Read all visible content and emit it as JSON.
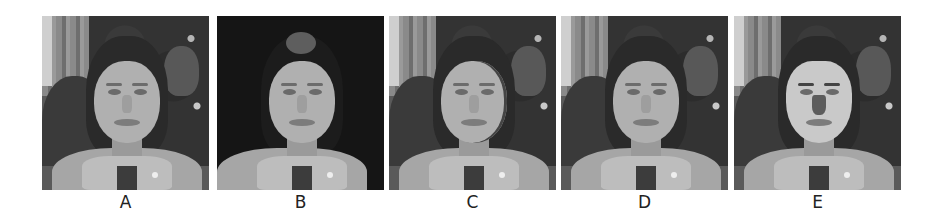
{
  "figure": {
    "panels": [
      {
        "id": "A",
        "label": "A",
        "description": "original photo of a woman with dark hair, hands clasped in front, busy background"
      },
      {
        "id": "B",
        "label": "B",
        "description": "same subject with background removed (black)"
      },
      {
        "id": "C",
        "label": "C",
        "description": "subject with visible face contour/edge artifacts"
      },
      {
        "id": "D",
        "label": "D",
        "description": "subject reconstructed, closely matching original"
      },
      {
        "id": "E",
        "label": "E",
        "description": "subject with a pasted uniform face region and darker nose"
      }
    ]
  }
}
